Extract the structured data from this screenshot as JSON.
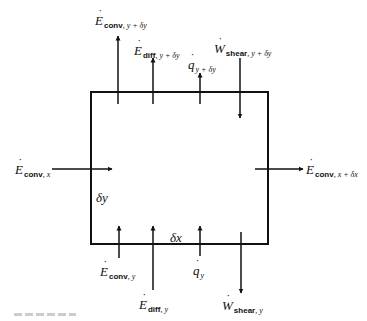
{
  "diagram": {
    "type": "control-volume energy balance",
    "control_volume": {
      "width_label": "δx",
      "height_label": "δy"
    },
    "arrows": [
      {
        "id": "e-conv-y-dy",
        "symbol": "E",
        "subscript": "conv, y + δy",
        "direction": "up",
        "side": "top"
      },
      {
        "id": "e-diff-y-dy",
        "symbol": "E",
        "subscript": "diff, y + δy",
        "direction": "up",
        "side": "top"
      },
      {
        "id": "q-y-dy",
        "symbol": "q",
        "subscript": "y + δy",
        "direction": "up",
        "side": "top"
      },
      {
        "id": "w-shear-y-dy",
        "symbol": "W",
        "subscript": "shear, y + δy",
        "direction": "down",
        "side": "top"
      },
      {
        "id": "e-conv-x",
        "symbol": "E",
        "subscript": "conv, x",
        "direction": "right",
        "side": "left"
      },
      {
        "id": "e-conv-x-dx",
        "symbol": "E",
        "subscript": "conv, x + δx",
        "direction": "right",
        "side": "right"
      },
      {
        "id": "e-conv-y",
        "symbol": "E",
        "subscript": "conv, y",
        "direction": "up",
        "side": "bottom"
      },
      {
        "id": "e-diff-y",
        "symbol": "E",
        "subscript": "diff, y",
        "direction": "up",
        "side": "bottom"
      },
      {
        "id": "q-y",
        "symbol": "q",
        "subscript": "y",
        "direction": "up",
        "side": "bottom"
      },
      {
        "id": "w-shear-y",
        "symbol": "W",
        "subscript": "shear, y",
        "direction": "down",
        "side": "bottom"
      }
    ]
  },
  "labels": {
    "e_conv_y_dy": {
      "sym": "E",
      "sub": "conv",
      "subvar": ", y + δy"
    },
    "e_diff_y_dy": {
      "sym": "E",
      "sub": "diff",
      "subvar": ", y + δy"
    },
    "q_y_dy": {
      "sym": "q",
      "subvar": "y + δy"
    },
    "w_shear_y_dy": {
      "sym": "W",
      "sub": "shear",
      "subvar": ", y + δy"
    },
    "e_conv_x": {
      "sym": "E",
      "sub": "conv",
      "subvar": ", x"
    },
    "e_conv_x_dx": {
      "sym": "E",
      "sub": "conv",
      "subvar": ", x + δx"
    },
    "e_conv_y": {
      "sym": "E",
      "sub": "conv",
      "subvar": ", y"
    },
    "e_diff_y": {
      "sym": "E",
      "sub": "diff",
      "subvar": ", y"
    },
    "q_y": {
      "sym": "q",
      "subvar": "y"
    },
    "w_shear_y": {
      "sym": "W",
      "sub": "shear",
      "subvar": ", y"
    },
    "dx": "δx",
    "dy": "δy"
  }
}
